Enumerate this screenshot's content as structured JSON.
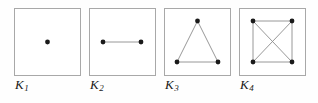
{
  "figure": {
    "background_color": "#fefefe",
    "box_border_color": "#a8a8a8",
    "vertex_color": "#1a1a1a",
    "edge_color": "#8c8c8c",
    "label_color": "#1a1a1a"
  },
  "panels": [
    {
      "id": "K1",
      "label_base": "K",
      "label_sub": "1",
      "vertex_count": 1,
      "edge_count": 0,
      "vertices": [
        {
          "name": "v1",
          "x": 33.5,
          "y": 34
        }
      ],
      "edges": []
    },
    {
      "id": "K2",
      "label_base": "K",
      "label_sub": "2",
      "vertex_count": 2,
      "edge_count": 1,
      "vertices": [
        {
          "name": "v1",
          "x": 14,
          "y": 34
        },
        {
          "name": "v2",
          "x": 52,
          "y": 34
        }
      ],
      "edges": [
        {
          "from": 0,
          "to": 1
        }
      ]
    },
    {
      "id": "K3",
      "label_base": "K",
      "label_sub": "3",
      "vertex_count": 3,
      "edge_count": 3,
      "vertices": [
        {
          "name": "v1",
          "x": 33.5,
          "y": 13
        },
        {
          "name": "v2",
          "x": 13,
          "y": 54
        },
        {
          "name": "v3",
          "x": 54,
          "y": 54
        }
      ],
      "edges": [
        {
          "from": 0,
          "to": 1
        },
        {
          "from": 0,
          "to": 2
        },
        {
          "from": 1,
          "to": 2
        }
      ]
    },
    {
      "id": "K4",
      "label_base": "K",
      "label_sub": "4",
      "vertex_count": 4,
      "edge_count": 6,
      "vertices": [
        {
          "name": "v1",
          "x": 14,
          "y": 13
        },
        {
          "name": "v2",
          "x": 53,
          "y": 13
        },
        {
          "name": "v3",
          "x": 14,
          "y": 54
        },
        {
          "name": "v4",
          "x": 53,
          "y": 54
        }
      ],
      "edges": [
        {
          "from": 0,
          "to": 1
        },
        {
          "from": 0,
          "to": 2
        },
        {
          "from": 1,
          "to": 3
        },
        {
          "from": 2,
          "to": 3
        },
        {
          "from": 0,
          "to": 3
        },
        {
          "from": 1,
          "to": 2
        }
      ]
    }
  ]
}
